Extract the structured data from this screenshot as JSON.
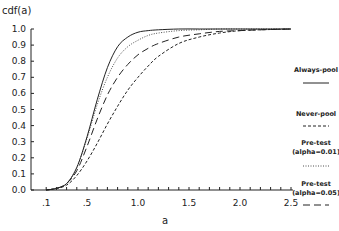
{
  "chart_data": {
    "type": "line",
    "title": "",
    "xlabel": "a",
    "ylabel": "cdf(a)",
    "xlim": [
      0,
      2.5
    ],
    "ylim": [
      0,
      1.0
    ],
    "grid": false,
    "legend_position": "right",
    "x_ticks": [
      ".1",
      ".5",
      "1.0",
      "1.5",
      "2.0",
      "2.5"
    ],
    "x_tick_values": [
      0.1,
      0.5,
      1.0,
      1.5,
      2.0,
      2.5
    ],
    "y_ticks": [
      "0.0",
      "0.1",
      "0.2",
      "0.3",
      "0.4",
      "0.5",
      "0.6",
      "0.7",
      "0.8",
      "0.9",
      "1.0"
    ],
    "x": [
      0.1,
      0.2,
      0.3,
      0.4,
      0.5,
      0.6,
      0.7,
      0.8,
      0.9,
      1.0,
      1.1,
      1.2,
      1.4,
      1.6,
      1.8,
      2.0,
      2.2,
      2.5
    ],
    "series": [
      {
        "name": "Always-pool",
        "style": "solid",
        "values": [
          0.0,
          0.01,
          0.04,
          0.14,
          0.33,
          0.56,
          0.76,
          0.89,
          0.95,
          0.98,
          0.99,
          0.995,
          1.0,
          1.0,
          1.0,
          1.0,
          1.0,
          1.0
        ]
      },
      {
        "name": "Never-pool",
        "style": "short-dash",
        "values": [
          0.0,
          0.01,
          0.03,
          0.09,
          0.18,
          0.29,
          0.41,
          0.52,
          0.62,
          0.7,
          0.77,
          0.83,
          0.91,
          0.95,
          0.975,
          0.99,
          0.995,
          1.0
        ]
      },
      {
        "name": "Pre-test (alpha=0.01)",
        "style": "dotted",
        "values": [
          0.0,
          0.01,
          0.04,
          0.14,
          0.32,
          0.53,
          0.7,
          0.82,
          0.89,
          0.93,
          0.96,
          0.975,
          0.99,
          0.995,
          1.0,
          1.0,
          1.0,
          1.0
        ]
      },
      {
        "name": "Pre-test (alpha=0.05)",
        "style": "long-dash",
        "values": [
          0.0,
          0.01,
          0.04,
          0.12,
          0.27,
          0.44,
          0.59,
          0.7,
          0.78,
          0.84,
          0.88,
          0.91,
          0.95,
          0.97,
          0.985,
          0.99,
          0.995,
          1.0
        ]
      }
    ]
  },
  "legend": {
    "items": [
      {
        "lines": [
          "Always-pool"
        ],
        "style": "solid"
      },
      {
        "lines": [
          "Never-pool"
        ],
        "style": "short-dash"
      },
      {
        "lines": [
          "Pre-test",
          "(alpha=0.01)"
        ],
        "style": "dotted"
      },
      {
        "lines": [
          "Pre-test",
          "(alpha=0.05)"
        ],
        "style": "long-dash"
      }
    ]
  }
}
